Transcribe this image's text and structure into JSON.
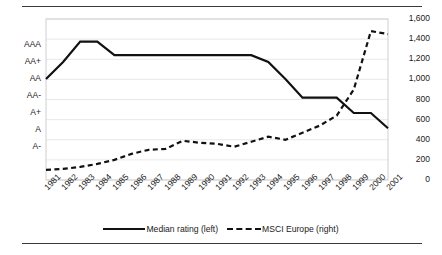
{
  "chart_data": {
    "type": "line",
    "title": "",
    "xlabel": "",
    "grid": true,
    "legend_position": "bottom",
    "categories": [
      "1981",
      "1982",
      "1983",
      "1984",
      "1985",
      "1986",
      "1987",
      "1988",
      "1989",
      "1990",
      "1991",
      "1992",
      "1993",
      "1994",
      "1995",
      "1996",
      "1997",
      "1998",
      "1999",
      "2000",
      "2001"
    ],
    "axes": {
      "left": {
        "label": "Median rating",
        "ticks": [
          "AAA",
          "AA+",
          "AA",
          "AA-",
          "A+",
          "A",
          "A-"
        ],
        "type": "ordinal-rating",
        "top_tick": "AAA",
        "bottom_tick": "A-"
      },
      "right": {
        "label": "MSCI Europe",
        "ticks": [
          "1,600",
          "1,400",
          "1,200",
          "1,000",
          "800",
          "600",
          "400",
          "200",
          "0"
        ],
        "ylim": [
          0,
          1600
        ]
      }
    },
    "series": [
      {
        "name": "Median rating (left)",
        "axis": "left",
        "style": "solid",
        "color": "#111111",
        "values": [
          "AA",
          "AA+",
          "AAA+",
          "AAA+",
          "AAA",
          "AAA",
          "AAA",
          "AAA",
          "AAA",
          "AAA",
          "AAA",
          "AAA",
          "AAA",
          "AA+",
          "AA",
          "A+",
          "A+",
          "A+",
          "A",
          "A",
          "A-"
        ],
        "numeric_values": [
          5.0,
          6.0,
          7.2,
          7.2,
          6.4,
          6.4,
          6.4,
          6.4,
          6.4,
          6.4,
          6.4,
          6.4,
          6.4,
          6.0,
          5.0,
          3.9,
          3.9,
          3.9,
          3.0,
          3.0,
          2.1
        ]
      },
      {
        "name": "MSCI Europe (right)",
        "axis": "right",
        "style": "dashed",
        "color": "#111111",
        "values": [
          100,
          110,
          130,
          160,
          200,
          260,
          300,
          310,
          390,
          370,
          360,
          330,
          380,
          430,
          400,
          470,
          540,
          640,
          900,
          1480,
          1450
        ]
      }
    ]
  },
  "legend": {
    "items": [
      {
        "label": "Median rating (left)",
        "style": "solid"
      },
      {
        "label": "MSCI Europe (right)",
        "style": "dashed"
      }
    ]
  }
}
